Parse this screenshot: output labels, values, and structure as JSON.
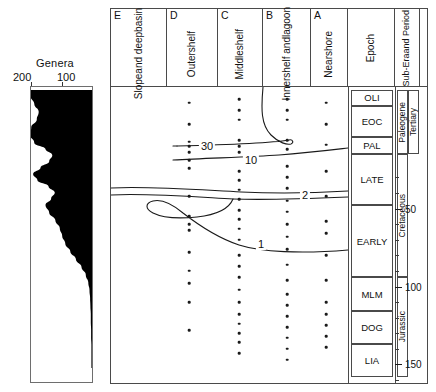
{
  "genera": {
    "title": "Genera",
    "axis_ticks": [
      "200",
      "100"
    ],
    "axis_tick_values": [
      200,
      100
    ]
  },
  "header": {
    "columns": [
      {
        "code": "E",
        "label": "Slope and deep basin",
        "lines": [
          "Slope",
          "and deep",
          "basin"
        ]
      },
      {
        "code": "D",
        "label": "Outer shelf",
        "lines": [
          "Outer",
          "shelf"
        ]
      },
      {
        "code": "C",
        "label": "Middle shelf",
        "lines": [
          "Middle",
          "shelf"
        ]
      },
      {
        "code": "B",
        "label": "Inner shelf and lagoon",
        "lines": [
          "Inner",
          "shelf and",
          "lagoon"
        ]
      },
      {
        "code": "A",
        "label": "Nearshore",
        "lines": [
          "Nearshore"
        ]
      },
      {
        "code": "",
        "label": "Epoch",
        "lines": [
          "Epoch"
        ]
      },
      {
        "code": "",
        "label": "Sub-Era and Period",
        "lines": [
          "Sub-Era",
          "and Period"
        ]
      },
      {
        "code": "",
        "label": "Ma BP",
        "lines": [
          "Ma BP"
        ]
      }
    ]
  },
  "epochs": [
    {
      "name": "OLI",
      "top_ma": 24,
      "bottom_ma": 34
    },
    {
      "name": "EOC",
      "top_ma": 34,
      "bottom_ma": 54
    },
    {
      "name": "PAL",
      "top_ma": 54,
      "bottom_ma": 65
    },
    {
      "name": "LATE",
      "top_ma": 65,
      "bottom_ma": 98
    },
    {
      "name": "EARLY",
      "top_ma": 98,
      "bottom_ma": 144
    },
    {
      "name": "MLM",
      "top_ma": 144,
      "bottom_ma": 166
    },
    {
      "name": "DOG",
      "top_ma": 166,
      "bottom_ma": 187
    },
    {
      "name": "LIA",
      "top_ma": 187,
      "bottom_ma": 208
    }
  ],
  "sub_eras": [
    {
      "name": "Paleogene",
      "top_ma": 24,
      "bottom_ma": 65
    },
    {
      "name": "Cretaceous",
      "top_ma": 65,
      "bottom_ma": 144
    },
    {
      "name": "Jurassic",
      "top_ma": 144,
      "bottom_ma": 208
    }
  ],
  "periods": [
    {
      "name": "Tertiary",
      "top_ma": 24,
      "bottom_ma": 65
    }
  ],
  "time_axis": {
    "label": "Ma BP",
    "min_ma": 22,
    "max_ma": 212,
    "major_labels": [
      "50",
      "100",
      "150",
      "200"
    ],
    "major_values": [
      50,
      100,
      150,
      200
    ],
    "minor_step": 10
  },
  "curve_labels": [
    {
      "text": "30",
      "ma": 58,
      "column": "D"
    },
    {
      "text": "10",
      "ma": 70,
      "column": "C"
    },
    {
      "text": "2",
      "ma": 112,
      "column": "B"
    },
    {
      "text": "1",
      "ma": 150,
      "column": "C"
    }
  ],
  "chart_data": {
    "type": "area",
    "title": "Genera",
    "xlabel": "Genera",
    "ylabel": "Ma BP",
    "xlim": [
      0,
      240
    ],
    "ylim": [
      212,
      22
    ],
    "grid": false,
    "legend": null,
    "series": [
      {
        "name": "Genera diversity",
        "x": [
          205,
          198,
          186,
          172,
          178,
          196,
          200,
          186,
          150,
          128,
          138,
          166,
          190,
          176,
          140,
          120,
          132,
          150,
          138,
          118,
          104,
          96,
          86,
          70,
          52,
          34,
          20,
          12,
          8,
          6,
          5,
          4,
          4,
          3,
          3,
          2,
          2,
          2,
          2
        ],
        "y": [
          24,
          28,
          33,
          38,
          43,
          48,
          53,
          58,
          62,
          66,
          70,
          74,
          78,
          82,
          86,
          90,
          94,
          98,
          103,
          108,
          113,
          118,
          123,
          128,
          133,
          138,
          143,
          148,
          153,
          158,
          163,
          168,
          173,
          178,
          183,
          188,
          193,
          198,
          203
        ]
      }
    ],
    "occurrence_columns": [
      {
        "code": "E",
        "label": "Slope and deep basin",
        "dot_ma": []
      },
      {
        "code": "D",
        "label": "Outer shelf",
        "dot_ma": [
          32,
          46,
          57,
          60,
          64,
          69,
          74,
          92,
          105,
          110,
          114,
          128,
          140,
          148,
          160,
          178
        ]
      },
      {
        "code": "C",
        "label": "Middle shelf",
        "dot_ma": [
          30,
          37,
          43,
          56,
          60,
          64,
          76,
          82,
          88,
          94,
          101,
          107,
          113,
          120,
          130,
          137,
          144,
          152,
          160,
          168,
          174,
          180,
          186,
          193
        ]
      },
      {
        "code": "B",
        "label": "Inner shelf and lagoon",
        "dot_ma": [
          30,
          37,
          43,
          56,
          62,
          73,
          80,
          87,
          95,
          102,
          110,
          118,
          126,
          136,
          146,
          155,
          162,
          169,
          176,
          183,
          190,
          197
        ]
      },
      {
        "code": "A",
        "label": "Nearshore",
        "dot_ma": [
          32,
          46,
          59,
          76,
          92,
          108,
          116,
          130,
          146,
          160,
          168,
          175,
          182,
          189
        ]
      }
    ],
    "contours": [
      {
        "level": 30,
        "description": "diversity contour 30"
      },
      {
        "level": 10,
        "description": "diversity contour 10"
      },
      {
        "level": 2,
        "description": "diversity contour 2"
      },
      {
        "level": 1,
        "description": "diversity contour 1"
      }
    ]
  }
}
